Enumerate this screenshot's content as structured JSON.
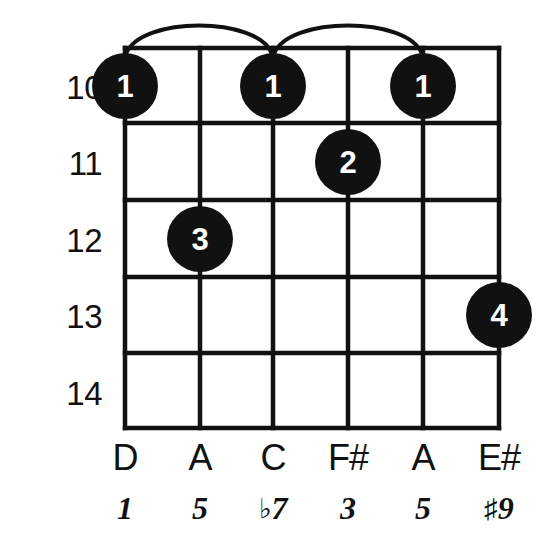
{
  "diagram": {
    "type": "guitar-chord-diagram",
    "title": "",
    "strings_count": 6,
    "frets_shown": 5,
    "ink_color": "#111111",
    "dot_color": "#111111",
    "dot_text_color": "#ffffff",
    "background_color": "#ffffff"
  },
  "fret_numbers": [
    {
      "label": "10"
    },
    {
      "label": "11"
    },
    {
      "label": "12"
    },
    {
      "label": "13"
    },
    {
      "label": "14"
    }
  ],
  "note_names": [
    {
      "label": "D"
    },
    {
      "label": "A"
    },
    {
      "label": "C"
    },
    {
      "label": "F#"
    },
    {
      "label": "A"
    },
    {
      "label": "E#"
    }
  ],
  "intervals": [
    {
      "accidental": "",
      "degree": "1"
    },
    {
      "accidental": "",
      "degree": "5"
    },
    {
      "accidental": "♭",
      "degree": "7"
    },
    {
      "accidental": "",
      "degree": "3"
    },
    {
      "accidental": "",
      "degree": "5"
    },
    {
      "accidental": "♯",
      "degree": "9"
    }
  ],
  "finger_dots": [
    {
      "finger": "1",
      "string": 1,
      "fret": "10"
    },
    {
      "finger": "1",
      "string": 3,
      "fret": "10"
    },
    {
      "finger": "1",
      "string": 5,
      "fret": "10"
    },
    {
      "finger": "2",
      "string": 4,
      "fret": "11"
    },
    {
      "finger": "3",
      "string": 2,
      "fret": "12"
    },
    {
      "finger": "4",
      "string": 6,
      "fret": "13"
    }
  ],
  "barre_arcs": [
    {
      "from_string": 1,
      "to_string": 3
    },
    {
      "from_string": 3,
      "to_string": 5
    }
  ]
}
